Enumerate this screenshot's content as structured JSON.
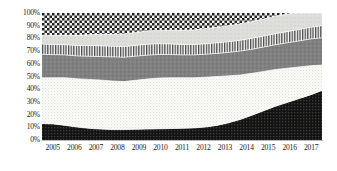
{
  "chart": {
    "title": "",
    "y_axis_label": "",
    "x_axis_label": ""
  },
  "y_ticks": [
    "100%",
    "90%",
    "80%",
    "70%",
    "60%",
    "50%",
    "40%",
    "30%",
    "20%",
    "10%",
    "0%"
  ],
  "x_ticks": [
    "2005",
    "2006",
    "2007",
    "2008",
    "2009",
    "2010",
    "2011",
    "2012",
    "2013",
    "2014",
    "2015",
    "2016",
    "2017"
  ],
  "colors": {
    "series_1_fill": "#1a1a1a",
    "series_2_fill": "#fbfbf8",
    "series_3_fill": "#808080",
    "series_4_fill": "#ffffff",
    "series_5_fill": "#d4d4d0",
    "series_6_fill": "#1a1a1a",
    "axis": "#b9b9b9",
    "text": "#1a1a1a",
    "background": "#ffffff"
  },
  "chart_data": {
    "type": "area",
    "stacked": true,
    "normalized_percent": true,
    "title": "",
    "xlabel": "",
    "ylabel": "",
    "ylim": [
      0,
      100
    ],
    "grid": false,
    "legend": "none",
    "x": [
      2005,
      2005.5,
      2006,
      2006.5,
      2007,
      2007.5,
      2008,
      2008.5,
      2009,
      2009.5,
      2010,
      2010.5,
      2011,
      2011.5,
      2012,
      2012.5,
      2013,
      2013.5,
      2014,
      2014.5,
      2015,
      2015.5,
      2016,
      2016.5,
      2017
    ],
    "x_tick_labels": [
      "2005",
      "2006",
      "2007",
      "2008",
      "2009",
      "2010",
      "2011",
      "2012",
      "2013",
      "2014",
      "2015",
      "2016",
      "2017"
    ],
    "y_tick_labels": [
      "0%",
      "10%",
      "20%",
      "30%",
      "40%",
      "50%",
      "60%",
      "70%",
      "80%",
      "90%",
      "100%"
    ],
    "series": [
      {
        "name": "Series 1 (bottom, solid dark)",
        "pattern": "solid-dark",
        "values": [
          13,
          12.6,
          11.5,
          10.2,
          9.2,
          8.6,
          8.2,
          8.2,
          8.4,
          8.6,
          8.8,
          9.0,
          9.2,
          9.5,
          10.2,
          11.5,
          13.5,
          16.2,
          19.5,
          23.0,
          26.5,
          29.5,
          32.5,
          35.5,
          39.0
        ]
      },
      {
        "name": "Series 2 (light dotted)",
        "pattern": "dotted-light",
        "values": [
          36.0,
          36.4,
          37.5,
          38.0,
          38.5,
          38.6,
          38.3,
          37.8,
          38.6,
          39.4,
          40.0,
          40.0,
          39.8,
          39.5,
          39.3,
          38.5,
          37.0,
          35.0,
          33.0,
          31.0,
          29.0,
          27.0,
          25.0,
          23.0,
          20.0
        ]
      },
      {
        "name": "Series 3 (medium gray solid)",
        "pattern": "solid-gray",
        "values": [
          18.5,
          18.2,
          18.0,
          18.0,
          18.2,
          18.5,
          19.0,
          19.2,
          19.0,
          18.8,
          18.5,
          18.3,
          18.0,
          18.0,
          18.0,
          18.2,
          18.5,
          18.8,
          19.0,
          19.2,
          19.5,
          20.0,
          20.5,
          21.0,
          21.5
        ]
      },
      {
        "name": "Series 4 (vertical stripes)",
        "pattern": "vertical-stripes",
        "values": [
          8.0,
          8.0,
          8.0,
          8.2,
          8.5,
          8.5,
          8.3,
          8.3,
          8.5,
          8.6,
          8.5,
          8.3,
          8.2,
          8.2,
          8.2,
          8.3,
          8.4,
          8.5,
          8.6,
          8.6,
          8.7,
          8.8,
          9.0,
          9.2,
          9.5
        ]
      },
      {
        "name": "Series 5 (light gray solid)",
        "pattern": "solid-light-gray",
        "values": [
          7.0,
          7.2,
          7.5,
          8.0,
          8.5,
          9.0,
          9.5,
          10.0,
          10.2,
          10.4,
          10.5,
          10.8,
          11.2,
          11.5,
          12.0,
          12.3,
          12.6,
          12.9,
          13.2,
          13.5,
          13.8,
          13.9,
          13.0,
          11.3,
          10.0
        ]
      },
      {
        "name": "Series 6 (top, checkerboard)",
        "pattern": "checkerboard",
        "values": [
          17.5,
          17.6,
          17.5,
          17.6,
          17.1,
          16.8,
          16.7,
          16.5,
          15.3,
          14.2,
          13.7,
          13.6,
          13.6,
          13.3,
          12.3,
          11.2,
          10.0,
          8.6,
          6.7,
          4.7,
          2.5,
          0.8,
          0.0,
          0.0,
          0.0
        ]
      }
    ]
  }
}
